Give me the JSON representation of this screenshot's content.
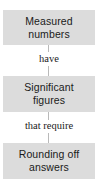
{
  "diagram": {
    "colors": {
      "node_background": "#dcdcdc",
      "text": "#1a1a1a",
      "connector": "#b9b9b9",
      "page_background": "#ffffff"
    },
    "nodes": [
      {
        "id": "measured",
        "line1": "Measured",
        "line2": "numbers"
      },
      {
        "id": "significant",
        "line1": "Significant",
        "line2": "figures"
      },
      {
        "id": "rounding",
        "line1": "Rounding off",
        "line2": "answers"
      }
    ],
    "edges": [
      {
        "id": "edge-have",
        "label": "have",
        "from": "measured",
        "to": "significant"
      },
      {
        "id": "edge-that-require",
        "label": "that require",
        "from": "significant",
        "to": "rounding"
      }
    ]
  }
}
